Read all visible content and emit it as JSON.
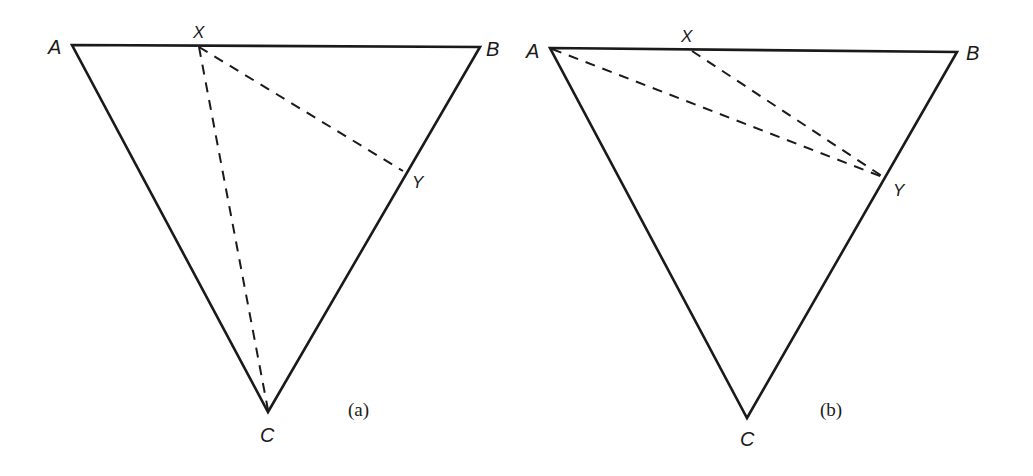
{
  "figures": [
    {
      "id": "a",
      "caption": "(a)",
      "vertices": {
        "A": {
          "label": "A",
          "x": 72,
          "y": 45
        },
        "B": {
          "label": "B",
          "x": 480,
          "y": 47
        },
        "C": {
          "label": "C",
          "x": 268,
          "y": 412
        },
        "X": {
          "label": "X",
          "x": 199,
          "y": 46
        },
        "Y": {
          "label": "Y",
          "x": 403,
          "y": 170
        }
      },
      "solid_edges": [
        "AB",
        "BC",
        "CA"
      ],
      "dashed_segments": [
        "XC",
        "XY"
      ]
    },
    {
      "id": "b",
      "caption": "(b)",
      "vertices": {
        "A": {
          "label": "A",
          "x": 550,
          "y": 48
        },
        "B": {
          "label": "B",
          "x": 957,
          "y": 52
        },
        "C": {
          "label": "C",
          "x": 747,
          "y": 418
        },
        "X": {
          "label": "X",
          "x": 692,
          "y": 50
        },
        "Y": {
          "label": "Y",
          "x": 885,
          "y": 178
        }
      },
      "solid_edges": [
        "AB",
        "BC",
        "CA"
      ],
      "dashed_segments": [
        "AY",
        "XY"
      ]
    }
  ],
  "colors": {
    "ink": "#1a1a1a",
    "background": "#ffffff"
  }
}
